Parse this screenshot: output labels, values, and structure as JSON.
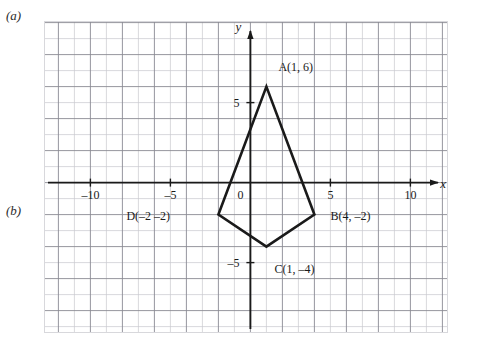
{
  "margin_labels": {
    "part_a": "(a)",
    "part_b": "(b)"
  },
  "chart_data": {
    "type": "scatter",
    "title": "",
    "xlabel": "x",
    "ylabel": "y",
    "xlim": [
      -12.9,
      12.3
    ],
    "ylim": [
      -9.4,
      10.1
    ],
    "grid": true,
    "legend": false,
    "x_ticks": [
      -10,
      -5,
      5,
      10
    ],
    "x_tick_labels": [
      "–10",
      "–5",
      "5",
      "10"
    ],
    "y_ticks": [
      5,
      -5
    ],
    "y_tick_labels": [
      "5",
      "–5"
    ],
    "origin_label": "0",
    "unit_px": 16,
    "minor_grid_step": 1,
    "major_grid_step": 2,
    "shape": {
      "name": "quadrilateral-ABCD",
      "closed": true,
      "vertices": [
        {
          "id": "A",
          "x": 1,
          "y": 6,
          "label": "A(1, 6)",
          "label_dx": 12,
          "label_dy": -16
        },
        {
          "id": "B",
          "x": 4,
          "y": -2,
          "label": "B(4, –2)",
          "label_dx": 16,
          "label_dy": 5
        },
        {
          "id": "C",
          "x": 1,
          "y": -4,
          "label": "C(1, –4)",
          "label_dx": 8,
          "label_dy": 26
        },
        {
          "id": "D",
          "x": -2,
          "y": -2,
          "label": "D(–2 –2)",
          "label_dx": -92,
          "label_dy": 5
        }
      ]
    }
  },
  "colors": {
    "shape_stroke": "#1a1a1a",
    "axis": "#1a1a1a",
    "grid_minor": "#c9c9cf",
    "grid_major": "#8a8a93",
    "border": "#d8d8dc",
    "text": "#1a1a1a"
  }
}
